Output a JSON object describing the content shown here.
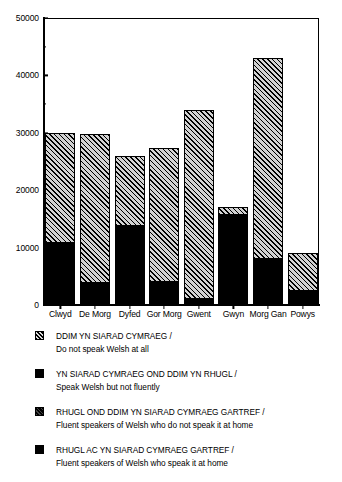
{
  "chart_data": {
    "type": "bar",
    "subtype": "stacked-bar",
    "title": "",
    "xlabel": "",
    "ylabel": "",
    "ylim": [
      0,
      50000
    ],
    "ytick_labels": [
      "0",
      "10000",
      "20000",
      "30000",
      "40000",
      "50000"
    ],
    "ytick_values": [
      0,
      10000,
      20000,
      30000,
      40000,
      50000
    ],
    "minor_ytick_values": [
      5000,
      15000,
      25000,
      35000,
      45000
    ],
    "grid": false,
    "legend_position": "below",
    "categories": [
      "Clwyd",
      "De Morg",
      "Dyfed",
      "Gor Morg",
      "Gwent",
      "Gwyn",
      "Morg Gan",
      "Powys"
    ],
    "series": [
      {
        "name": "DDIM YN SIARAD CYMRAEG / Do not speak Welsh at all",
        "fill": "hatch",
        "values": [
          19000,
          26000,
          12000,
          23300,
          33000,
          1000,
          35000,
          6500
        ]
      },
      {
        "name": "YN SIARAD CYMRAEG OND DDIM YN RHUGL / Speak Welsh but not fluently",
        "fill": "solid",
        "values": [
          11000,
          3800,
          14000,
          4000,
          1000,
          16000,
          8000,
          2500
        ]
      }
    ],
    "totals": [
      30000,
      29800,
      26000,
      27300,
      34000,
      17000,
      43000,
      9000
    ]
  },
  "legend": {
    "entries": [
      {
        "swatch": "hatch",
        "welsh": "DDIM YN SIARAD CYMRAEG /",
        "english": "Do not speak Welsh at all"
      },
      {
        "swatch": "solid",
        "welsh": "YN SIARAD CYMRAEG OND DDIM YN RHUGL /",
        "english": "Speak Welsh but not fluently"
      },
      {
        "swatch": "solid-dim",
        "welsh": "RHUGL OND DDIM YN SIARAD CYMRAEG GARTREF /",
        "english": "Fluent speakers of Welsh who do not speak it at home"
      },
      {
        "swatch": "solid",
        "welsh": "RHUGL AC YN SIARAD CYMRAEG GARTREF /",
        "english": "Fluent speakers of Welsh who speak it at home"
      }
    ]
  },
  "colors": {
    "ink": "#000000",
    "background": "#ffffff",
    "hatch_fill": "#d2d2d2"
  }
}
